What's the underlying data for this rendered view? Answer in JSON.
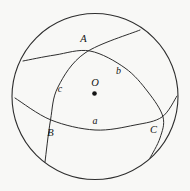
{
  "figure": {
    "points": {
      "A": "A",
      "B": "B",
      "C": "C",
      "O": "O"
    },
    "arcs": {
      "a": "a",
      "b": "b",
      "c": "c"
    },
    "colors": {
      "line": "#2e2e2e",
      "ink": "#141414",
      "background": "#f8f8f6"
    }
  }
}
